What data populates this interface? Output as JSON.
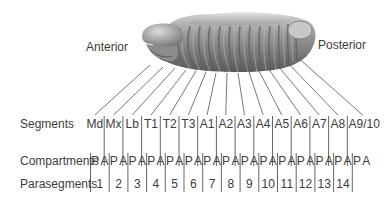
{
  "diagram": {
    "orientation_labels": {
      "anterior": "Anterior",
      "posterior": "Posterior"
    },
    "embryo": {
      "description": "segmented insect embryo",
      "fill": "#8a8a8a",
      "highlight": "#c4c4c4",
      "shadow": "#555555"
    },
    "rows": {
      "segments_title": "Segments",
      "compartments_title": "Compartments",
      "parasegments_title": "Parasegments"
    },
    "segments": [
      "Md",
      "Mx",
      "Lb",
      "T1",
      "T2",
      "T3",
      "A1",
      "A2",
      "A3",
      "A4",
      "A5",
      "A6",
      "A7",
      "A8",
      "A9/10"
    ],
    "compartments": [
      "P",
      "A",
      "P",
      "A",
      "P",
      "A",
      "P",
      "A",
      "P",
      "A",
      "P",
      "A",
      "P",
      "A",
      "P",
      "A",
      "P",
      "A",
      "P",
      "A",
      "P",
      "A",
      "P",
      "A",
      "P",
      "A",
      "P",
      "A",
      "P",
      "A"
    ],
    "parasegments": [
      "1",
      "2",
      "3",
      "4",
      "5",
      "6",
      "7",
      "8",
      "9",
      "10",
      "11",
      "12",
      "13",
      "14"
    ],
    "line_color": "#555555"
  }
}
